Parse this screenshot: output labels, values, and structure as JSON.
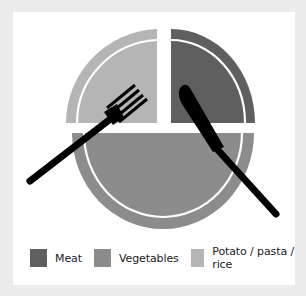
{
  "diagram": {
    "type": "plate-model",
    "sections": [
      {
        "name": "Meat",
        "portion": "one quarter",
        "position": "top-right",
        "color": "#5f5f5f"
      },
      {
        "name": "Vegetables",
        "portion": "one half",
        "position": "bottom",
        "color": "#8c8c8c"
      },
      {
        "name": "Potato / pasta / rice",
        "portion": "one quarter",
        "position": "top-left",
        "color": "#b5b5b5"
      }
    ],
    "utensils": [
      "fork",
      "knife"
    ]
  },
  "legend": {
    "items": [
      {
        "label": "Meat",
        "color": "#5f5f5f"
      },
      {
        "label": "Vegetables",
        "color": "#8c8c8c"
      },
      {
        "label": "Potato / pasta / rice",
        "color": "#b5b5b5"
      }
    ]
  },
  "colors": {
    "background": "#ececec",
    "card": "#ffffff",
    "utensil": "#000000"
  }
}
